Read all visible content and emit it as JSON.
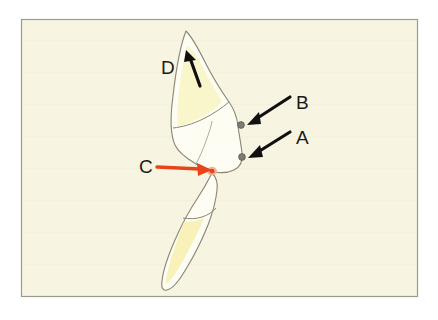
{
  "figure": {
    "kind": "anatomical-line-drawing",
    "panel": {
      "background_color": "#f7f5e2",
      "border_color": "#9a9a8e",
      "outer_background_color": "#ffffff",
      "x": 21,
      "y": 19,
      "width": 397,
      "height": 278
    },
    "palette": {
      "outline": "#8a8574",
      "enamel_fill": "#fdfdf4",
      "dentin_fill": "#faf6c9",
      "dentin_fill_deep": "#f8f0b4",
      "black_arrow": "#101010",
      "red_arrow": "#e8441a",
      "marker_dot": "#7d7d72",
      "label_color": "#1a1a1a"
    }
  },
  "labels": [
    {
      "id": "label-a",
      "text": "A",
      "x": 296,
      "y": 144,
      "arrow_color": "#101010",
      "arrow_from": [
        291,
        133
      ],
      "arrow_to": [
        248,
        158
      ],
      "points_to": "marker-dot-lower"
    },
    {
      "id": "label-b",
      "text": "B",
      "x": 296,
      "y": 109,
      "arrow_color": "#101010",
      "arrow_from": [
        291,
        98
      ],
      "arrow_to": [
        247,
        126
      ],
      "points_to": "marker-dot-upper"
    },
    {
      "id": "label-c",
      "text": "C",
      "x": 139,
      "y": 173,
      "arrow_color": "#e8441a",
      "arrow_from": [
        157,
        166
      ],
      "arrow_to": [
        211,
        170
      ],
      "points_to": "contact-point"
    },
    {
      "id": "label-d",
      "text": "D",
      "x": 161,
      "y": 74,
      "arrow_color": "#101010",
      "arrow_from": [
        200,
        86
      ],
      "arrow_to": [
        187,
        51
      ],
      "points_to": "crown-apex-region"
    }
  ],
  "markers": [
    {
      "id": "marker-dot-upper",
      "x": 241,
      "y": 125,
      "r": 3.4,
      "color": "#7d7d72"
    },
    {
      "id": "marker-dot-lower",
      "x": 242,
      "y": 157,
      "r": 3.4,
      "color": "#7d7d72"
    }
  ],
  "shapes": {
    "upper_tooth_label": "upper tooth outline",
    "lower_tooth_label": "lower tooth outline",
    "upper_dentin_label": "upper tooth dentin region",
    "lower_dentin_label": "lower tooth dentin region"
  }
}
